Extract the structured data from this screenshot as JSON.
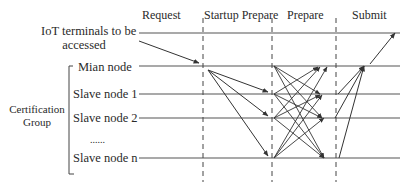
{
  "diagram": {
    "phases": [
      {
        "label": "Request",
        "x": 162
      },
      {
        "label": "Startup Prepare",
        "x": 238
      },
      {
        "label": "Prepare",
        "x": 304
      },
      {
        "label": "Submit",
        "x": 366
      }
    ],
    "actors": [
      {
        "label_line1": "IoT terminals to be",
        "label_line2": "accessed"
      },
      {
        "label": "Mian node"
      },
      {
        "label": "Slave node 1"
      },
      {
        "label": "Slave node 2"
      },
      {
        "label": "......"
      },
      {
        "label": "Slave node n"
      }
    ],
    "group": {
      "label_line1": "Certification",
      "label_line2": "Group"
    },
    "colors": {
      "line": "#3a3a3a",
      "text": "#2a2a2a",
      "background": "#ffffff"
    }
  }
}
